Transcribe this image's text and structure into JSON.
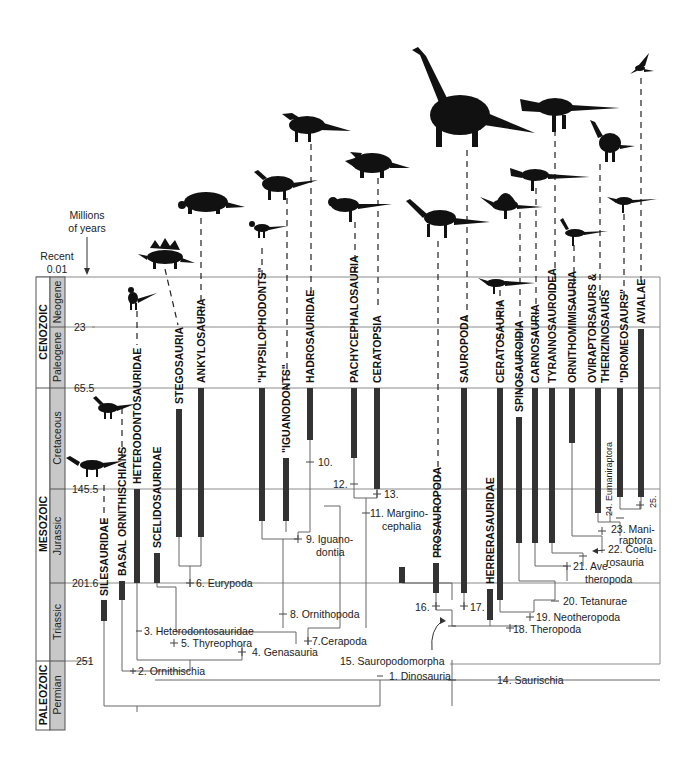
{
  "axis": {
    "units_label_line1": "Millions",
    "units_label_line2": "of years",
    "recent_label": "Recent",
    "ticks": [
      {
        "value": "0.01",
        "y": 277
      },
      {
        "value": "23",
        "y": 327
      },
      {
        "value": "65.5",
        "y": 388
      },
      {
        "value": "145.5",
        "y": 489
      },
      {
        "value": "201.6",
        "y": 583
      },
      {
        "value": "251",
        "y": 661
      }
    ]
  },
  "eras": [
    {
      "name": "CENOZOIC",
      "top": 277,
      "bottom": 388
    },
    {
      "name": "MESOZOIC",
      "top": 388,
      "bottom": 661
    },
    {
      "name": "PALEOZOIC",
      "top": 661,
      "bottom": 730
    }
  ],
  "periods": [
    {
      "name": "Neogene",
      "top": 277,
      "bottom": 327
    },
    {
      "name": "Paleogene",
      "top": 327,
      "bottom": 388
    },
    {
      "name": "Cretaceous",
      "top": 388,
      "bottom": 489
    },
    {
      "name": "Jurassic",
      "top": 489,
      "bottom": 583
    },
    {
      "name": "Triassic",
      "top": 583,
      "bottom": 661
    },
    {
      "name": "Permian",
      "top": 661,
      "bottom": 730
    }
  ],
  "taxa": [
    {
      "name": "SILESAURIDAE",
      "x": 104,
      "bar_top": 600,
      "bar_bottom": 621
    },
    {
      "name": "BASAL ORNITHISCHIANS",
      "x": 122,
      "bar_top": 581,
      "bar_bottom": 600
    },
    {
      "name": "HETERODONTOSAURIDAE",
      "x": 137,
      "bar_top": 489,
      "bar_bottom": 583
    },
    {
      "name": "SCELIDOSAURIDAE",
      "x": 157,
      "bar_top": 553,
      "bar_bottom": 583
    },
    {
      "name": "STEGOSAURIA",
      "x": 179,
      "bar_top": 409,
      "bar_bottom": 537
    },
    {
      "name": "ANKYLOSAURIA",
      "x": 201,
      "bar_top": 388,
      "bar_bottom": 537
    },
    {
      "name": "\"HYPSILOPHODONTS\"",
      "x": 262,
      "bar_top": 388,
      "bar_bottom": 521
    },
    {
      "name": "\"IGUANODONTS\"",
      "x": 286,
      "bar_top": 458,
      "bar_bottom": 521
    },
    {
      "name": "HADROSAURIDAE",
      "x": 310,
      "bar_top": 388,
      "bar_bottom": 440
    },
    {
      "name": "PACHYCEPHALOSAURIA",
      "x": 354,
      "bar_top": 388,
      "bar_bottom": 458
    },
    {
      "name": "CERATOPSIA",
      "x": 377,
      "bar_top": 388,
      "bar_bottom": 489
    },
    {
      "name": "PROSAUROPODA",
      "x": 436,
      "bar_top": 563,
      "bar_bottom": 593
    },
    {
      "name": "SAUROPODA",
      "x": 464,
      "bar_top": 388,
      "bar_bottom": 593
    },
    {
      "name": "HERRERASAURIDAE",
      "x": 489,
      "bar_top": 589,
      "bar_bottom": 620
    },
    {
      "name": "CERATOSAURIA",
      "x": 500,
      "bar_top": 388,
      "bar_bottom": 600
    },
    {
      "name": "SPINOSAUROIDIA",
      "x": 519,
      "bar_top": 417,
      "bar_bottom": 543
    },
    {
      "name": "CARNOSAURIA",
      "x": 535,
      "bar_top": 388,
      "bar_bottom": 543
    },
    {
      "name": "TYRANNOSAUROIDEA",
      "x": 552,
      "bar_top": 388,
      "bar_bottom": 543
    },
    {
      "name": "ORNITHOMIMISAURIA",
      "x": 572,
      "bar_top": 388,
      "bar_bottom": 443
    },
    {
      "name": "OVIRAPTORSAURS &",
      "name2": "THERIZINOSAURS",
      "x": 598,
      "bar_top": 388,
      "bar_bottom": 513
    },
    {
      "name": "\"DROMEOSAURS\"",
      "x": 620,
      "bar_top": 388,
      "bar_bottom": 497
    },
    {
      "name": "AVIALAE",
      "x": 641,
      "bar_top": 329,
      "bar_bottom": 497
    }
  ],
  "nodes": [
    {
      "label": "1. Dinosauria"
    },
    {
      "label": "2. Ornithischia"
    },
    {
      "label": "3. Heterodontosauridae"
    },
    {
      "label": "4. Genasauria"
    },
    {
      "label": "5. Thyreophora"
    },
    {
      "label": "6. Eurypoda"
    },
    {
      "label": "7.Cerapoda"
    },
    {
      "label": "8. Ornithopoda"
    },
    {
      "label": "9. Iguano-",
      "label2": "dontia"
    },
    {
      "label": "10."
    },
    {
      "label": "11. Margino-",
      "label2": "cephalia"
    },
    {
      "label": "12."
    },
    {
      "label": "13."
    },
    {
      "label": "14. Saurischia"
    },
    {
      "label": "15. Sauropodomorpha"
    },
    {
      "label": "16."
    },
    {
      "label": "17."
    },
    {
      "label": "18. Theropoda"
    },
    {
      "label": "19. Neotheropoda"
    },
    {
      "label": "20. Tetanurae"
    },
    {
      "label": "21. Ave-",
      "label2": "theropoda"
    },
    {
      "label": "22. Coelu-",
      "label2": "rosauria"
    },
    {
      "label": "23. Mani-",
      "label2": "raptora"
    },
    {
      "label": "24. Eumaniraptora"
    },
    {
      "label": "25."
    }
  ],
  "colors": {
    "bar": "#333333",
    "period_fill": "#c8c8c8",
    "line": "#777777",
    "silhouette": "#111111"
  }
}
